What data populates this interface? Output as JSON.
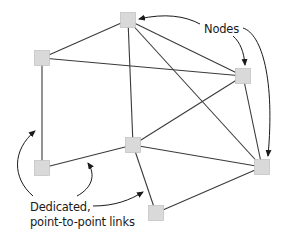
{
  "diagram": {
    "type": "network-topology",
    "labels": {
      "nodes": "Nodes",
      "links_line1": "Dedicated,",
      "links_line2": "point-to-point links"
    },
    "colors": {
      "node_fill": "#d9d9d9",
      "edge": "#3a3a3a",
      "text": "#1a1a1a"
    },
    "nodes": [
      {
        "id": "top",
        "x": 128,
        "y": 20
      },
      {
        "id": "left-top",
        "x": 42,
        "y": 58
      },
      {
        "id": "right-mid",
        "x": 243,
        "y": 76
      },
      {
        "id": "center",
        "x": 133,
        "y": 145
      },
      {
        "id": "left-bottom",
        "x": 42,
        "y": 168
      },
      {
        "id": "right-bottom",
        "x": 262,
        "y": 167
      },
      {
        "id": "bottom",
        "x": 156,
        "y": 213
      }
    ],
    "edges": [
      [
        "top",
        "left-top"
      ],
      [
        "top",
        "center"
      ],
      [
        "top",
        "right-mid"
      ],
      [
        "top",
        "right-bottom"
      ],
      [
        "left-top",
        "right-mid"
      ],
      [
        "left-top",
        "left-bottom"
      ],
      [
        "left-bottom",
        "center"
      ],
      [
        "center",
        "right-mid"
      ],
      [
        "center",
        "right-bottom"
      ],
      [
        "center",
        "bottom"
      ],
      [
        "right-mid",
        "right-bottom"
      ],
      [
        "bottom",
        "right-bottom"
      ]
    ],
    "callouts": {
      "nodes_points_to": [
        "top",
        "right-mid",
        "right-bottom"
      ],
      "links_points_to": [
        "left-top—left-bottom",
        "left-bottom—center",
        "center—bottom"
      ]
    }
  }
}
